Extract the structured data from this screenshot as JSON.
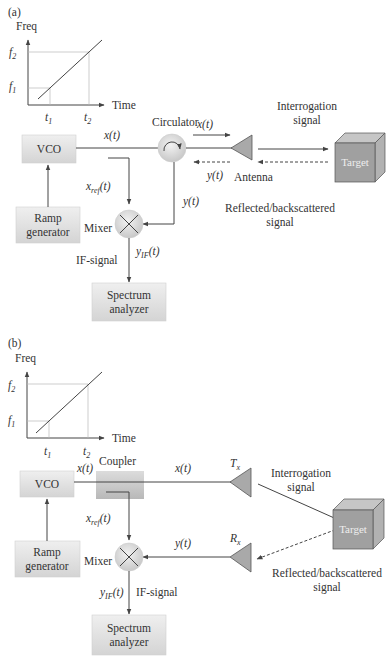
{
  "panels": [
    {
      "id": "a",
      "label": "(a)",
      "chart": {
        "y_axis": "Freq",
        "x_axis": "Time",
        "y_ticks": [
          "f",
          "f"
        ],
        "y_subs": [
          "2",
          "1"
        ],
        "x_ticks": [
          "t",
          "t"
        ],
        "x_subs": [
          "1",
          "2"
        ]
      },
      "blocks": {
        "vco": "VCO",
        "ramp_line1": "Ramp",
        "ramp_line2": "generator",
        "spectrum_line1": "Spectrum",
        "spectrum_line2": "analyzer",
        "target": "Target"
      },
      "labels": {
        "circulator": "Circulator",
        "antenna": "Antenna",
        "mixer": "Mixer",
        "if_signal": "IF-signal",
        "x_t_main": "x(t)",
        "x_t_circ": "x(t)",
        "y_t_ant": "y(t)",
        "y_t_mixer": "y(t)",
        "x_ref": "x",
        "x_ref_sub": "ref",
        "x_ref_arg": "(t)",
        "y_if": "y",
        "y_if_sub": "IF",
        "y_if_arg": "(t)",
        "interrogation_1": "Interrogation",
        "interrogation_2": "signal",
        "reflected_1": "Reflected/backscattered",
        "reflected_2": "signal"
      }
    },
    {
      "id": "b",
      "label": "(b)",
      "chart": {
        "y_axis": "Freq",
        "x_axis": "Time",
        "y_ticks": [
          "f",
          "f"
        ],
        "y_subs": [
          "2",
          "1"
        ],
        "x_ticks": [
          "t",
          "t"
        ],
        "x_subs": [
          "1",
          "2"
        ]
      },
      "blocks": {
        "vco": "VCO",
        "ramp_line1": "Ramp",
        "ramp_line2": "generator",
        "spectrum_line1": "Spectrum",
        "spectrum_line2": "analyzer",
        "target": "Target"
      },
      "labels": {
        "coupler": "Coupler",
        "mixer": "Mixer",
        "if_signal": "IF-signal",
        "x_t_vco": "x(t)",
        "x_t_tx": "x(t)",
        "y_t_rx": "y(t)",
        "tx": "T",
        "tx_sub": "x",
        "rx": "R",
        "rx_sub": "x",
        "x_ref": "x",
        "x_ref_sub": "ref",
        "x_ref_arg": "(t)",
        "y_if": "y",
        "y_if_sub": "IF",
        "y_if_arg": "(t)",
        "interrogation_1": "Interrogation",
        "interrogation_2": "signal",
        "reflected_1": "Reflected/backscattered",
        "reflected_2": "signal"
      }
    }
  ],
  "colors": {
    "block_fill_top": "#ececec",
    "block_fill_bottom": "#d6d6d6",
    "target_front": "#9e9e9e",
    "target_top": "#c4c4c4",
    "target_side": "#b0b0b0",
    "antenna": "#a9a9a9",
    "line": "#444444"
  }
}
